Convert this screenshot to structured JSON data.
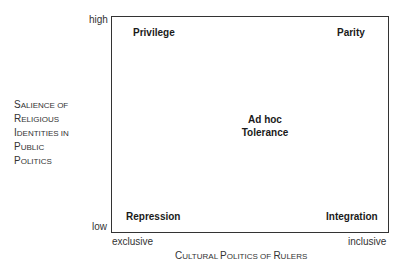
{
  "diagram": {
    "type": "2x2 conceptual matrix",
    "y_axis": {
      "label_lines": [
        "Salience of",
        "Religious",
        "Identities in",
        "Public",
        "Politics"
      ],
      "high": "high",
      "low": "low"
    },
    "x_axis": {
      "label": "Cultural Politics of Rulers",
      "low": "exclusive",
      "high": "inclusive"
    },
    "quadrants": {
      "top_left": "Privilege",
      "top_right": "Parity",
      "center_line1": "Ad hoc",
      "center_line2": "Tolerance",
      "bottom_left": "Repression",
      "bottom_right": "Integration"
    },
    "colors": {
      "line": "#333333",
      "text": "#222222",
      "background": "#ffffff"
    }
  }
}
